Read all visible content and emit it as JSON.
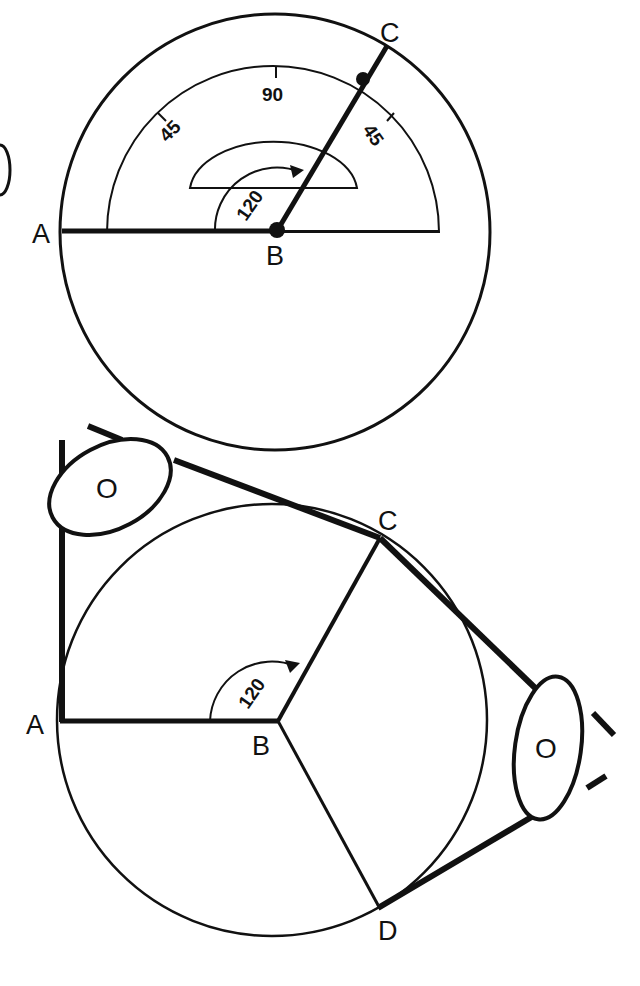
{
  "figure": {
    "top": {
      "title": "Protractor measuring angle ABC",
      "points": {
        "A": "A",
        "B": "B",
        "C": "C"
      },
      "scale_labels": {
        "left": "45",
        "center": "90",
        "right": "45"
      },
      "angle_label": "120"
    },
    "bottom": {
      "title": "Belt wrapped around wheel over two pulleys",
      "points": {
        "A": "A",
        "B": "B",
        "C": "C",
        "D": "D"
      },
      "angle_label": "120",
      "pulley_left_label": "O",
      "pulley_right_label": "O"
    }
  },
  "colors": {
    "ink": "#111111",
    "background": "#ffffff"
  }
}
